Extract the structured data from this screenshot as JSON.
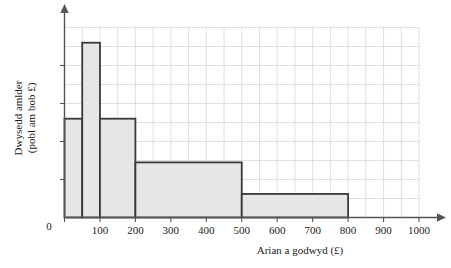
{
  "chart_data": {
    "type": "bar",
    "title": "",
    "xlabel": "Arian a godwyd (£)",
    "ylabel": "Dwysedd amlder (pobl am bob £)",
    "ylabel_line1": "Dwysedd amlder",
    "ylabel_line2": "(pobl am bob £)",
    "origin_label": "0",
    "xlim": [
      0,
      1000
    ],
    "ylim": [
      0,
      5
    ],
    "xticks": [
      0,
      100,
      200,
      300,
      400,
      500,
      600,
      700,
      800,
      900,
      1000
    ],
    "xtick_labels": [
      "0",
      "100",
      "200",
      "300",
      "400",
      "500",
      "600",
      "700",
      "800",
      "900",
      "1000"
    ],
    "yticks": [
      0,
      1,
      2,
      3,
      4
    ],
    "ytick_labels": [
      "",
      "",
      "",
      "",
      ""
    ],
    "grid": true,
    "grid_x_step": 50,
    "grid_y_step": 0.5,
    "legend": "none",
    "bin_edges": [
      0,
      50,
      100,
      200,
      500,
      800
    ],
    "bars": [
      {
        "x0": 0,
        "x1": 50,
        "height": 2.6
      },
      {
        "x0": 50,
        "x1": 100,
        "height": 4.6
      },
      {
        "x0": 100,
        "x1": 200,
        "height": 2.6
      },
      {
        "x0": 200,
        "x1": 500,
        "height": 1.45
      },
      {
        "x0": 500,
        "x1": 800,
        "height": 0.62
      }
    ],
    "bar_fill": "#e6e6e6",
    "bar_stroke": "#3a3a3a",
    "axis_color": "#555555",
    "grid_color": "#d8d8d8"
  }
}
